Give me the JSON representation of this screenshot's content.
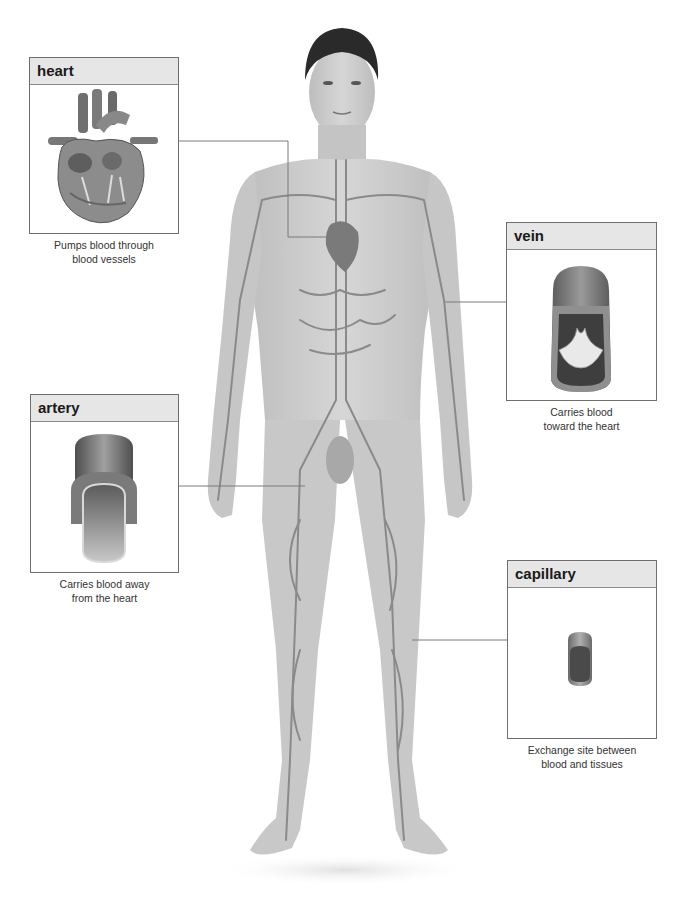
{
  "diagram": {
    "callouts": [
      {
        "id": "heart",
        "title": "heart",
        "caption": "Pumps blood through\nblood vessels",
        "icon": "heart-illustration"
      },
      {
        "id": "vein",
        "title": "vein",
        "caption": "Carries blood\ntoward the heart",
        "icon": "vein-cross-section"
      },
      {
        "id": "artery",
        "title": "artery",
        "caption": "Carries blood away\nfrom the heart",
        "icon": "artery-cross-section"
      },
      {
        "id": "capillary",
        "title": "capillary",
        "caption": "Exchange site between\nblood and tissues",
        "icon": "capillary-cross-section"
      }
    ]
  },
  "colors": {
    "header_bg": "#e6e6e6",
    "border": "#6e6e6e",
    "skin": "#c9c9c9",
    "vessel": "#8a8a8a",
    "hair": "#2a2a2a"
  }
}
